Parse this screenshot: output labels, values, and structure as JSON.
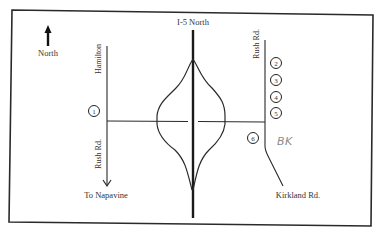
{
  "diagram": {
    "compass": {
      "label": "North",
      "icon": "north-arrow-icon"
    },
    "highway": {
      "label": "I-5 North"
    },
    "roads": {
      "hamilton": "Hamilton",
      "rush_rd_left": "Rush Rd.",
      "rush_rd_right": "Rush Rd.",
      "kirkland": "Kirkland Rd."
    },
    "destinations": {
      "napavine": "To Napavine"
    },
    "markers": [
      {
        "id": "1",
        "label": "1"
      },
      {
        "id": "2",
        "label": "2"
      },
      {
        "id": "3",
        "label": "3"
      },
      {
        "id": "4",
        "label": "4"
      },
      {
        "id": "5",
        "label": "5"
      },
      {
        "id": "6",
        "label": "6"
      }
    ],
    "annotation": {
      "text": "BK",
      "color": "#8a8a8a"
    },
    "colors": {
      "ink": "#222222",
      "text": "#333333"
    }
  }
}
